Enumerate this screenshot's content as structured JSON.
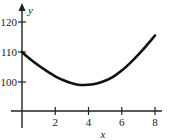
{
  "chart_data": {
    "type": "line",
    "title": "",
    "xlabel": "x",
    "ylabel": "y",
    "xlim": [
      0,
      8
    ],
    "ylim": [
      90,
      124
    ],
    "grid": false,
    "x_ticks": [
      2,
      4,
      6,
      8
    ],
    "x_tick_labels": [
      "2",
      "4",
      "6",
      "8"
    ],
    "y_ticks": [
      100,
      110,
      120
    ],
    "y_tick_labels": [
      "100",
      "110",
      "120"
    ],
    "series": [
      {
        "name": "curve",
        "x": [
          0,
          0.5,
          1,
          1.5,
          2,
          2.5,
          3,
          3.5,
          4,
          4.5,
          5,
          5.5,
          6,
          6.5,
          7,
          7.5,
          8
        ],
        "values": [
          110,
          107.6,
          105.5,
          103.6,
          101.9,
          100.6,
          99.6,
          99.0,
          99.1,
          99.5,
          100.4,
          101.8,
          103.8,
          106.3,
          109.1,
          112.2,
          115.5
        ]
      }
    ],
    "color": "#111111"
  }
}
